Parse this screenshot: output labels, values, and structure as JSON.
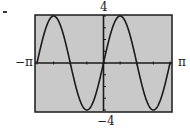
{
  "chart_data": {
    "type": "line",
    "title": "",
    "xlabel": "",
    "ylabel": "",
    "function": "y = 4 sin(2x)",
    "xlim": [
      -3.14159,
      3.14159
    ],
    "ylim": [
      -4,
      4
    ],
    "x_tick_labels": {
      "min": "−π",
      "max": "π"
    },
    "y_tick_labels": {
      "min": "−4",
      "max": "4"
    },
    "x_tick_step": "π/4",
    "y_tick_step": 1,
    "grid": false,
    "series": [
      {
        "name": "4sin(2x)",
        "x": [
          -3.1416,
          -2.3562,
          -1.5708,
          -0.7854,
          0,
          0.7854,
          1.5708,
          2.3562,
          3.1416
        ],
        "values": [
          0,
          4,
          0,
          -4,
          0,
          4,
          0,
          -4,
          0
        ]
      }
    ],
    "colors": {
      "background": "#c9c9c9",
      "curve": "#1a1a1a",
      "frame": "#1a1a1a"
    }
  },
  "labels": {
    "x_min": "−π",
    "x_max": "π",
    "y_max": "4",
    "y_min": "−4"
  }
}
